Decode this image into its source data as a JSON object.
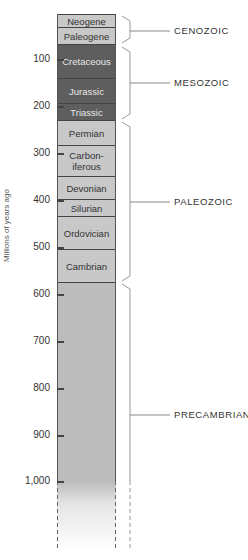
{
  "axis": {
    "label": "Millions of years ago",
    "ticks": [
      {
        "value": 100,
        "label": "100",
        "y": 59
      },
      {
        "value": 200,
        "label": "200",
        "y": 106
      },
      {
        "value": 300,
        "label": "300",
        "y": 153
      },
      {
        "value": 400,
        "label": "400",
        "y": 200
      },
      {
        "value": 500,
        "label": "500",
        "y": 247
      },
      {
        "value": 600,
        "label": "600",
        "y": 294
      },
      {
        "value": 700,
        "label": "700",
        "y": 341
      },
      {
        "value": 800,
        "label": "800",
        "y": 388
      },
      {
        "value": 900,
        "label": "900",
        "y": 435
      },
      {
        "value": 1000,
        "label": "1,000",
        "y": 481
      }
    ]
  },
  "periods": [
    {
      "name": "Neogene",
      "era": "Cenozoic",
      "top": 14,
      "bottom": 27,
      "shade": "light"
    },
    {
      "name": "Paleogene",
      "era": "Cenozoic",
      "top": 27,
      "bottom": 44,
      "shade": "light"
    },
    {
      "name": "Cretaceous",
      "era": "Mesozoic",
      "top": 44,
      "bottom": 78,
      "shade": "dark"
    },
    {
      "name": "Jurassic",
      "era": "Mesozoic",
      "top": 78,
      "bottom": 103,
      "shade": "dark"
    },
    {
      "name": "Triassic",
      "era": "Mesozoic",
      "top": 103,
      "bottom": 120,
      "shade": "dark"
    },
    {
      "name": "Permian",
      "era": "Paleozoic",
      "top": 120,
      "bottom": 145,
      "shade": "light"
    },
    {
      "name": "Carbon-\niferous",
      "era": "Paleozoic",
      "top": 145,
      "bottom": 176,
      "shade": "light"
    },
    {
      "name": "Devonian",
      "era": "Paleozoic",
      "top": 176,
      "bottom": 199,
      "shade": "light"
    },
    {
      "name": "Silurian",
      "era": "Paleozoic",
      "top": 199,
      "bottom": 216,
      "shade": "light"
    },
    {
      "name": "Ordovician",
      "era": "Paleozoic",
      "top": 216,
      "bottom": 249,
      "shade": "light"
    },
    {
      "name": "Cambrian",
      "era": "Paleozoic",
      "top": 249,
      "bottom": 282,
      "shade": "light"
    }
  ],
  "precambrian": {
    "top": 282,
    "solid_bottom": 481,
    "dashed_bottom": 550
  },
  "eras": [
    {
      "label": "CENOZOIC",
      "top": 16,
      "bottom": 43,
      "label_y": 31
    },
    {
      "label": "MESOZOIC",
      "top": 47,
      "bottom": 119,
      "label_y": 83
    },
    {
      "label": "PALEOZOIC",
      "top": 122,
      "bottom": 281,
      "label_y": 202
    },
    {
      "label": "PRECAMBRIAN",
      "top": 284,
      "bottom": 481,
      "label_y": 415
    }
  ],
  "colors": {
    "light": "#c8c8c8",
    "dark": "#5e5e5e",
    "precambrian": "#bcbcbc",
    "line": "#444444"
  },
  "chart_data": {
    "type": "table",
    "ylabel": "Millions of years ago",
    "ylim": [
      0,
      1000
    ],
    "yticks": [
      100,
      200,
      300,
      400,
      500,
      600,
      700,
      800,
      900,
      1000
    ],
    "eras": [
      {
        "name": "CENOZOIC",
        "periods": [
          "Neogene",
          "Paleogene"
        ],
        "start_mya": 65,
        "end_mya": 0
      },
      {
        "name": "MESOZOIC",
        "periods": [
          "Cretaceous",
          "Jurassic",
          "Triassic"
        ],
        "start_mya": 230,
        "end_mya": 65
      },
      {
        "name": "PALEOZOIC",
        "periods": [
          "Permian",
          "Carboniferous",
          "Devonian",
          "Silurian",
          "Ordovician",
          "Cambrian"
        ],
        "start_mya": 570,
        "end_mya": 230
      },
      {
        "name": "PRECAMBRIAN",
        "periods": [],
        "start_mya": ">1000",
        "end_mya": 570
      }
    ],
    "period_boundaries_mya": {
      "Neogene": [
        0,
        32
      ],
      "Paleogene": [
        32,
        65
      ],
      "Cretaceous": [
        65,
        140
      ],
      "Jurassic": [
        140,
        195
      ],
      "Triassic": [
        195,
        230
      ],
      "Permian": [
        230,
        285
      ],
      "Carboniferous": [
        285,
        350
      ],
      "Devonian": [
        350,
        400
      ],
      "Silurian": [
        400,
        435
      ],
      "Ordovician": [
        435,
        505
      ],
      "Cambrian": [
        505,
        575
      ]
    }
  }
}
